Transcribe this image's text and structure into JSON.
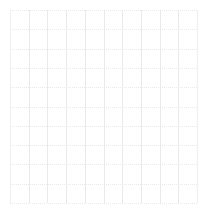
{
  "canvas": {
    "width": 207,
    "height": 220,
    "background": "#ffffff"
  },
  "chart_data": {
    "type": "line",
    "title": "",
    "subtitle": "",
    "xlabel": "",
    "ylabel": "",
    "series": [],
    "categories": [],
    "values": [],
    "legend": {
      "entries": [],
      "position": "none"
    },
    "annotations": [],
    "grid": {
      "visible": true,
      "vertical_lines": 11,
      "horizontal_lines": 11,
      "vertical_style": "solid",
      "horizontal_style": "dotted",
      "color": "#e9e9e9",
      "minor_color": "#efefef",
      "line_width": 1
    },
    "xaxis": {
      "tick_labels": [],
      "range": [
        0,
        10
      ],
      "visible_axis_line": false
    },
    "yaxis": {
      "tick_labels": [],
      "range": [
        0,
        10
      ],
      "visible_axis_line": false
    },
    "note": "Empty plot canvas: gridlines only, no plotted data, no text labels"
  },
  "plot_area": {
    "left": 10,
    "top": 10,
    "right": 197,
    "bottom": 203,
    "width": 187,
    "height": 193,
    "columns": 10,
    "rows": 10,
    "column_step": 18.7,
    "row_step": 19.3
  },
  "gridlines": {
    "vertical_x": [
      10,
      28.7,
      47.4,
      66.1,
      84.8,
      103.5,
      122.2,
      140.9,
      159.6,
      178.3,
      197
    ],
    "horizontal_y": [
      10,
      29.3,
      48.6,
      67.9,
      87.2,
      106.5,
      125.8,
      145.1,
      164.4,
      183.7,
      203
    ]
  },
  "minor_ticks": {
    "clusters": [
      {
        "x": 160,
        "y_start": 30,
        "y_end": 46,
        "color": "#ececec"
      }
    ]
  },
  "colors": {
    "background": "#ffffff",
    "gridline": "#e9e9e9",
    "gridline_light": "#efefef",
    "minor_tick": "#ececec"
  }
}
